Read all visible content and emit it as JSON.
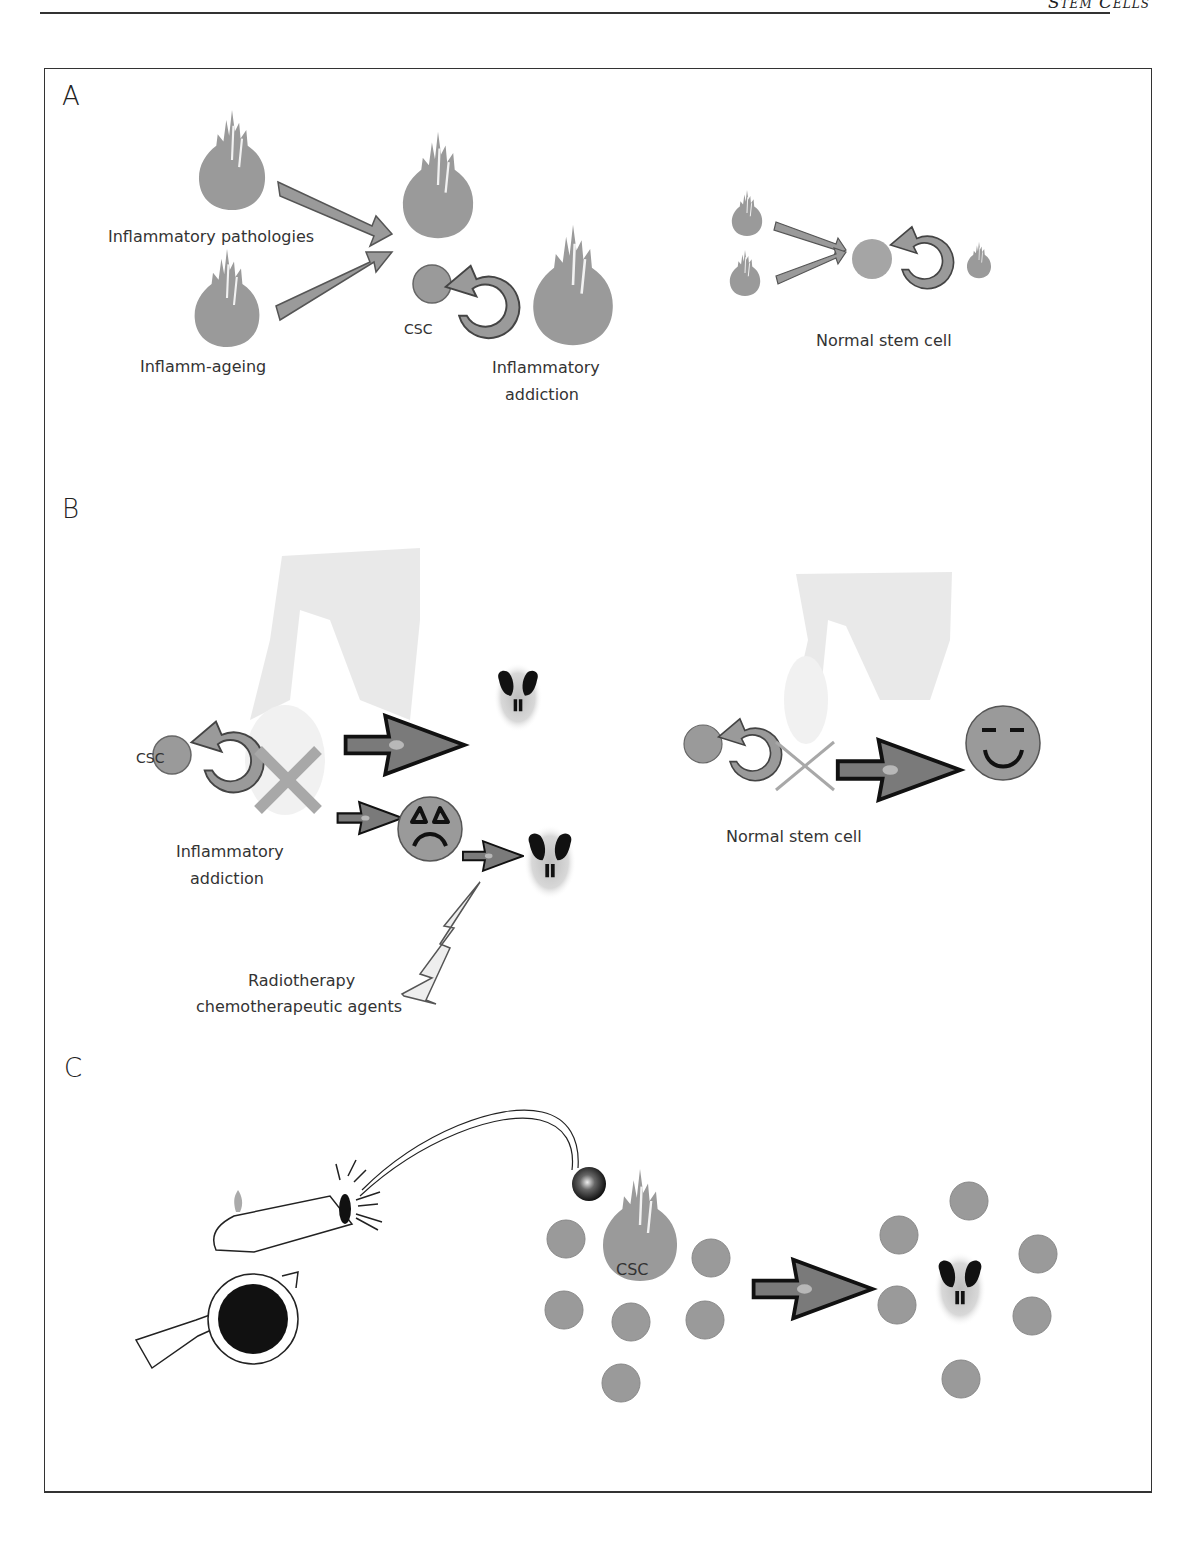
{
  "header": {
    "journal_title": "Stem Cells"
  },
  "colors": {
    "shape_grey": "#9a9a9a",
    "light_grey": "#d4d4d4",
    "outline": "#555555",
    "dark": "#111111"
  },
  "panels": {
    "A": {
      "letter": "A",
      "labels": {
        "inflammatory_pathologies": "Inflammatory pathologies",
        "inflamm_ageing": "Inflamm-ageing",
        "csc": "CSC",
        "inflammatory_addiction_line1": "Inflammatory",
        "inflammatory_addiction_line2": "addiction",
        "normal_stem_cell": "Normal stem cell"
      }
    },
    "B": {
      "letter": "B",
      "labels": {
        "csc": "CSC",
        "inflammatory_addiction_line1": "Inflammatory",
        "inflammatory_addiction_line2": "addiction",
        "radiotherapy_line1": "Radiotherapy",
        "radiotherapy_line2": "chemotherapeutic agents",
        "normal_stem_cell": "Normal stem cell"
      }
    },
    "C": {
      "letter": "C",
      "labels": {
        "csc": "CSC"
      }
    }
  }
}
